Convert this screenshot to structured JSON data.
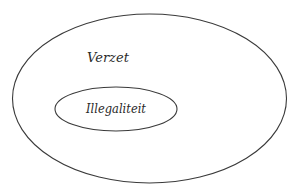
{
  "diagram": {
    "type": "nested-sets",
    "outer": {
      "label": "Verzet"
    },
    "inner": {
      "label": "Illegaliteit"
    },
    "colors": {
      "stroke": "#3a3a3a",
      "text": "#2a2a2a",
      "background": "#ffffff"
    }
  }
}
